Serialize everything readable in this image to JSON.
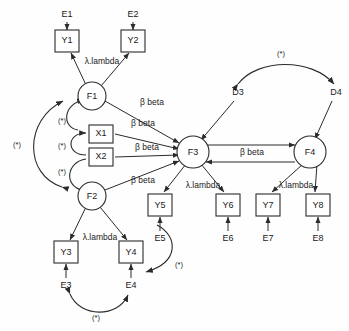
{
  "diagram": {
    "type": "structural-equation-model",
    "colors": {
      "stroke": "#2b2b2b",
      "background": "#ffffff",
      "text": "#1a1a1a"
    },
    "labels": {
      "lambda": "λ.lambda",
      "beta": "β beta",
      "star": "(*)"
    },
    "nodes": [
      {
        "id": "E1",
        "label": "E1",
        "shape": "none",
        "x": 67,
        "y": 15
      },
      {
        "id": "E2",
        "label": "E2",
        "shape": "none",
        "x": 133,
        "y": 15
      },
      {
        "id": "Y1",
        "label": "Y1",
        "shape": "box",
        "x": 67,
        "y": 40
      },
      {
        "id": "Y2",
        "label": "Y2",
        "shape": "box",
        "x": 133,
        "y": 40
      },
      {
        "id": "F1",
        "label": "F1",
        "shape": "circle",
        "x": 92,
        "y": 96
      },
      {
        "id": "X1",
        "label": "X1",
        "shape": "box",
        "x": 101,
        "y": 134
      },
      {
        "id": "X2",
        "label": "X2",
        "shape": "box",
        "x": 101,
        "y": 157
      },
      {
        "id": "F2",
        "label": "F2",
        "shape": "circle",
        "x": 92,
        "y": 196
      },
      {
        "id": "F3",
        "label": "F3",
        "shape": "circle",
        "x": 193,
        "y": 152
      },
      {
        "id": "F4",
        "label": "F4",
        "shape": "circle",
        "x": 310,
        "y": 152
      },
      {
        "id": "D3",
        "label": "D3",
        "shape": "none",
        "x": 238,
        "y": 93
      },
      {
        "id": "D4",
        "label": "D4",
        "shape": "none",
        "x": 336,
        "y": 93
      },
      {
        "id": "Y3",
        "label": "Y3",
        "shape": "box",
        "x": 66,
        "y": 252
      },
      {
        "id": "Y4",
        "label": "Y4",
        "shape": "box",
        "x": 131,
        "y": 252
      },
      {
        "id": "E3",
        "label": "E3",
        "shape": "none",
        "x": 66,
        "y": 285
      },
      {
        "id": "E4",
        "label": "E4",
        "shape": "none",
        "x": 131,
        "y": 285
      },
      {
        "id": "Y5",
        "label": "Y5",
        "shape": "box",
        "x": 160,
        "y": 205
      },
      {
        "id": "Y6",
        "label": "Y6",
        "shape": "box",
        "x": 228,
        "y": 205
      },
      {
        "id": "Y7",
        "label": "Y7",
        "shape": "box",
        "x": 268,
        "y": 205
      },
      {
        "id": "Y8",
        "label": "Y8",
        "shape": "box",
        "x": 318,
        "y": 205
      },
      {
        "id": "E5",
        "label": "E5",
        "shape": "none",
        "x": 160,
        "y": 238
      },
      {
        "id": "E6",
        "label": "E6",
        "shape": "none",
        "x": 228,
        "y": 238
      },
      {
        "id": "E7",
        "label": "E7",
        "shape": "none",
        "x": 268,
        "y": 238
      },
      {
        "id": "E8",
        "label": "E8",
        "shape": "none",
        "x": 318,
        "y": 238
      }
    ],
    "edge_labels": [
      {
        "id": "lam-f1",
        "text": "λ.lambda",
        "x": 102,
        "y": 62
      },
      {
        "id": "beta-f1-f3",
        "text": "β beta",
        "x": 152,
        "y": 103
      },
      {
        "id": "beta-x1-f3",
        "text": "β beta",
        "x": 143,
        "y": 124
      },
      {
        "id": "beta-x2-f3",
        "text": "β beta",
        "x": 147,
        "y": 148
      },
      {
        "id": "beta-f2-f3",
        "text": "β beta",
        "x": 143,
        "y": 181
      },
      {
        "id": "beta-f3-f4",
        "text": "β beta",
        "x": 252,
        "y": 153
      },
      {
        "id": "lam-f3",
        "text": "λ.lambda",
        "x": 203,
        "y": 186
      },
      {
        "id": "lam-f4",
        "text": "λ.lambda",
        "x": 296,
        "y": 186
      },
      {
        "id": "lam-f2",
        "text": "λ.lambda",
        "x": 100,
        "y": 238
      }
    ],
    "star_labels": [
      {
        "id": "star-f1f2-outer",
        "x": 17,
        "y": 145
      },
      {
        "id": "star-f1x1",
        "x": 62,
        "y": 121
      },
      {
        "id": "star-x1x2",
        "x": 62,
        "y": 146
      },
      {
        "id": "star-x2f2",
        "x": 62,
        "y": 172
      },
      {
        "id": "star-d3d4",
        "x": 281,
        "y": 54
      },
      {
        "id": "star-e5e4",
        "x": 179,
        "y": 265
      },
      {
        "id": "star-e3e4",
        "x": 96,
        "y": 318
      }
    ]
  }
}
